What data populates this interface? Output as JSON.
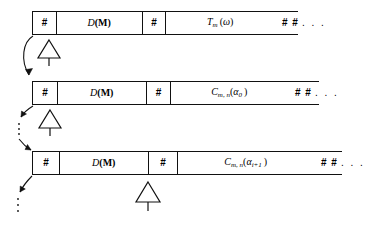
{
  "diagram": {
    "rows": [
      {
        "id": "row-1",
        "cells": [
          {
            "name": "hash-cell-1",
            "text": "#"
          },
          {
            "name": "dm-cell",
            "text": "D(M)"
          },
          {
            "name": "hash-cell-2",
            "text": "#"
          },
          {
            "name": "payload-cell",
            "text": "Tm(ω)"
          },
          {
            "name": "hash-ellipsis-cell",
            "text": "# # . . ."
          }
        ],
        "payload_parts": {
          "base": "T",
          "sub": "m",
          "arg": "(ω)"
        }
      },
      {
        "id": "row-2",
        "cells": [
          {
            "name": "hash-cell-1",
            "text": "#"
          },
          {
            "name": "dm-cell",
            "text": "D(M)"
          },
          {
            "name": "hash-cell-2",
            "text": "#"
          },
          {
            "name": "payload-cell",
            "text": "Cm,n(α0)"
          },
          {
            "name": "hash-ellipsis-cell",
            "text": "# # . . ."
          }
        ],
        "payload_parts": {
          "base": "C",
          "sub": "m, n",
          "arg_open": "(",
          "arg_base": "α",
          "arg_sub": "0",
          "arg_close": ")"
        }
      },
      {
        "id": "row-3",
        "cells": [
          {
            "name": "hash-cell-1",
            "text": "#"
          },
          {
            "name": "dm-cell",
            "text": "D(M)"
          },
          {
            "name": "hash-cell-2",
            "text": "#"
          },
          {
            "name": "payload-cell",
            "text": "Cm,n(αi+1)"
          },
          {
            "name": "hash-ellipsis-cell",
            "text": "# # . . ."
          }
        ],
        "payload_parts": {
          "base": "C",
          "sub": "m, n",
          "arg_open": "(",
          "arg_base": "α",
          "arg_sub": "i+1",
          "arg_close": ")"
        }
      }
    ],
    "labels": {
      "hash": "#",
      "dm_italic": "D",
      "dm_bold": "(M)",
      "hash_pair": "# #",
      "ellipsis": ". . .",
      "vertical_ellipsis": "⋮",
      "alpha": "α",
      "omega": "ω",
      "t_base": "T",
      "c_base": "C",
      "sub_m": "m",
      "sub_mn": "m, n",
      "sub_zero": "0",
      "sub_iplus1": "i+1"
    },
    "antennas": [
      {
        "name": "antenna-triangle-1",
        "row": "row-1"
      },
      {
        "name": "antenna-triangle-2",
        "row": "row-2"
      },
      {
        "name": "antenna-triangle-3",
        "row": "row-3"
      }
    ],
    "connectors": [
      {
        "name": "arrow-row1-to-row2",
        "style": "solid-curved"
      },
      {
        "name": "arrow-row2-down",
        "style": "solid-short"
      },
      {
        "name": "arrow-into-row3",
        "style": "solid-short"
      },
      {
        "name": "arrow-row3-down",
        "style": "solid-short"
      }
    ],
    "colors": {
      "line": "#111111",
      "background": "#ffffff",
      "text": "#000000"
    }
  }
}
